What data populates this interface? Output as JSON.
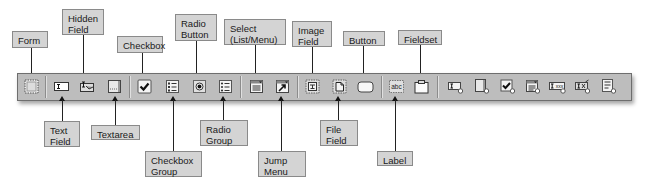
{
  "toolbar": {
    "name": "Forms insert toolbar",
    "buttons": [
      {
        "id": "form",
        "label": "Form",
        "icon": "form-icon"
      },
      {
        "id": "text-field",
        "label": "Text Field",
        "icon": "text-field-icon"
      },
      {
        "id": "hidden-field",
        "label": "Hidden Field",
        "icon": "hidden-field-icon"
      },
      {
        "id": "textarea",
        "label": "Textarea",
        "icon": "textarea-icon"
      },
      {
        "id": "checkbox",
        "label": "Checkbox",
        "icon": "checkbox-icon"
      },
      {
        "id": "checkbox-group",
        "label": "Checkbox Group",
        "icon": "checkbox-group-icon"
      },
      {
        "id": "radio-button",
        "label": "Radio Button",
        "icon": "radio-button-icon"
      },
      {
        "id": "radio-group",
        "label": "Radio Group",
        "icon": "radio-group-icon"
      },
      {
        "id": "select",
        "label": "Select (List/Menu)",
        "icon": "select-list-icon"
      },
      {
        "id": "jump-menu",
        "label": "Jump Menu",
        "icon": "jump-menu-icon"
      },
      {
        "id": "image-field",
        "label": "Image Field",
        "icon": "image-field-icon"
      },
      {
        "id": "file-field",
        "label": "File Field",
        "icon": "file-field-icon"
      },
      {
        "id": "button",
        "label": "Button",
        "icon": "button-icon"
      },
      {
        "id": "label",
        "label": "Label",
        "icon": "label-icon"
      },
      {
        "id": "fieldset",
        "label": "Fieldset",
        "icon": "fieldset-icon"
      },
      {
        "id": "spry-text-field",
        "label": "",
        "icon": "spry-validation-text-field-icon"
      },
      {
        "id": "spry-textarea",
        "label": "",
        "icon": "spry-validation-textarea-icon"
      },
      {
        "id": "spry-checkbox",
        "label": "",
        "icon": "spry-validation-checkbox-icon"
      },
      {
        "id": "spry-select",
        "label": "",
        "icon": "spry-validation-select-icon"
      },
      {
        "id": "spry-password",
        "label": "",
        "icon": "spry-validation-password-icon"
      },
      {
        "id": "spry-confirm",
        "label": "",
        "icon": "spry-validation-confirm-icon"
      },
      {
        "id": "spry-radio-group",
        "label": "",
        "icon": "spry-validation-radio-group-icon"
      }
    ]
  },
  "callouts_top": {
    "form": "Form",
    "hidden_field": "Hidden\nField",
    "checkbox": "Checkbox",
    "radio_button": "Radio\nButton",
    "select": "Select\n(List/Menu)",
    "image_field": "Image\nField",
    "button": "Button",
    "fieldset": "Fieldset"
  },
  "callouts_bottom": {
    "text_field": "Text\nField",
    "textarea": "Textarea",
    "checkbox_group": "Checkbox\nGroup",
    "radio_group": "Radio\nGroup",
    "jump_menu": "Jump\nMenu",
    "file_field": "File\nField",
    "label": "Label"
  },
  "colors": {
    "toolbar_bg": "#bdbdbd",
    "callout_bg": "#d4d4d4",
    "callout_border": "#8a8a8a",
    "leader_line": "#222222"
  }
}
